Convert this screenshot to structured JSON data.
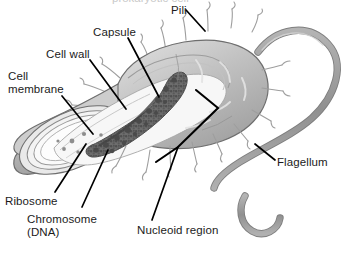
{
  "figure": {
    "background_color": "#ffffff",
    "text_color": "#1b1b1b",
    "cropped_text_top": "prokaryotic cell"
  },
  "palette": {
    "outline": "#6e6e6e",
    "outline_dark": "#4a4a4a",
    "capsule_fill": "#b9b9b9",
    "capsule_fill_light": "#d2d2d2",
    "cell_wall_fill": "#e6e6e6",
    "membrane_fill": "#f2f2f2",
    "cytoplasm_fill": "#fbfbfb",
    "nucleoid_fill": "#6b6b6b",
    "nucleoid_dark": "#505050",
    "flagellum_fill": "#9a9a9a",
    "pili_stroke": "#9e9e9e",
    "leader_line": "#000000"
  },
  "labels": [
    {
      "id": "pili",
      "text": "Pili",
      "x": 171,
      "y": 4,
      "points_to": "hair-like projection on upper cell surface"
    },
    {
      "id": "capsule",
      "text": "Capsule",
      "x": 93,
      "y": 26,
      "points_to": "outermost envelope layer"
    },
    {
      "id": "cell-wall",
      "text": "Cell wall",
      "x": 46,
      "y": 48,
      "points_to": "middle envelope layer"
    },
    {
      "id": "cell-membrane",
      "text": "Cell membrane",
      "x": 8,
      "y": 70,
      "line1": "Cell",
      "line2": "membrane",
      "points_to": "innermost envelope layer"
    },
    {
      "id": "ribosome",
      "text": "Ribosome",
      "x": 5,
      "y": 195,
      "points_to": "small dots inside cytoplasm"
    },
    {
      "id": "chromosome-dna",
      "text": "Chromosome (DNA)",
      "x": 27,
      "y": 213,
      "line1": "Chromosome",
      "line2": "(DNA)",
      "points_to": "stippled strand inside nucleoid"
    },
    {
      "id": "nucleoid-region",
      "text": "Nucleoid region",
      "x": 137,
      "y": 224,
      "points_to": "central dark mass region"
    },
    {
      "id": "flagellum",
      "text": "Flagellum",
      "x": 277,
      "y": 156,
      "points_to": "long looping tail"
    }
  ],
  "structures": [
    {
      "id": "capsule-layer",
      "name": "Capsule",
      "description": "outer gray envelope surrounding the rod-shaped cell"
    },
    {
      "id": "cell-wall-layer",
      "name": "Cell wall",
      "description": "rigid layer beneath the capsule"
    },
    {
      "id": "cell-membrane-layer",
      "name": "Cell membrane",
      "description": "thin layer enclosing the cytoplasm"
    },
    {
      "id": "cytoplasm",
      "name": "Cytoplasm",
      "description": "pale interior revealed by the cut-away"
    },
    {
      "id": "nucleoid",
      "name": "Nucleoid region",
      "description": "dark stippled mass of coiled chromosome"
    },
    {
      "id": "ribosomes",
      "name": "Ribosomes",
      "description": "scattered small dots in the cytoplasm"
    },
    {
      "id": "pili-set",
      "name": "Pili",
      "description": "short hair-like projections around the cell surface"
    },
    {
      "id": "flagellum-tail",
      "name": "Flagellum",
      "description": "single long whip-like tail looping from the right pole"
    }
  ]
}
